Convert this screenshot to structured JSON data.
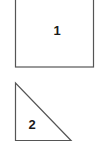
{
  "shapes": [
    {
      "type": "square",
      "label": "1"
    },
    {
      "type": "right-triangle",
      "label": "2"
    }
  ],
  "colors": {
    "stroke": "#555555",
    "text": "#1a1a1a",
    "background": "#ffffff"
  }
}
